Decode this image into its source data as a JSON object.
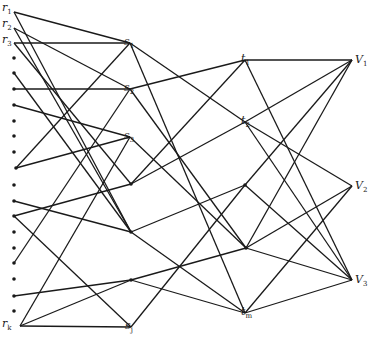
{
  "diagram": {
    "type": "layered-graph",
    "layers": [
      "r",
      "s",
      "t",
      "V"
    ],
    "nodes": {
      "r": [
        {
          "id": "r1",
          "label": "r",
          "sub": "1",
          "x": 14,
          "y": 12
        },
        {
          "id": "r2",
          "label": "r",
          "sub": "2",
          "x": 14,
          "y": 28
        },
        {
          "id": "r3",
          "label": "r",
          "sub": "3",
          "x": 14,
          "y": 43
        },
        {
          "id": "r4",
          "x": 14,
          "y": 58
        },
        {
          "id": "r5",
          "x": 14,
          "y": 73
        },
        {
          "id": "r6",
          "x": 14,
          "y": 89
        },
        {
          "id": "r7",
          "x": 14,
          "y": 105
        },
        {
          "id": "r8",
          "x": 14,
          "y": 121
        },
        {
          "id": "r9",
          "x": 14,
          "y": 136
        },
        {
          "id": "r10",
          "x": 14,
          "y": 152
        },
        {
          "id": "r11",
          "x": 16,
          "y": 168
        },
        {
          "id": "r12",
          "x": 14,
          "y": 185
        },
        {
          "id": "r13",
          "x": 14,
          "y": 201
        },
        {
          "id": "r14",
          "x": 14,
          "y": 216
        },
        {
          "id": "r15",
          "x": 14,
          "y": 232
        },
        {
          "id": "r16",
          "x": 14,
          "y": 248
        },
        {
          "id": "r17",
          "x": 14,
          "y": 263
        },
        {
          "id": "r18",
          "x": 14,
          "y": 279
        },
        {
          "id": "r19",
          "x": 14,
          "y": 296
        },
        {
          "id": "r20",
          "x": 14,
          "y": 311
        },
        {
          "id": "rk",
          "label": "r",
          "sub": "k",
          "x": 20,
          "y": 326
        }
      ],
      "s": [
        {
          "id": "s1",
          "label": "s",
          "sub": "1",
          "x": 130,
          "y": 43
        },
        {
          "id": "s2",
          "label": "s",
          "sub": "2",
          "x": 130,
          "y": 89
        },
        {
          "id": "s3",
          "label": "s",
          "sub": "3",
          "x": 130,
          "y": 137
        },
        {
          "id": "s4",
          "x": 131,
          "y": 184
        },
        {
          "id": "s5",
          "x": 131,
          "y": 232
        },
        {
          "id": "s6",
          "x": 131,
          "y": 280
        },
        {
          "id": "sj",
          "label": "s",
          "sub": "j",
          "x": 131,
          "y": 327
        }
      ],
      "t": [
        {
          "id": "t1",
          "label": "t",
          "sub": "1",
          "x": 245,
          "y": 60
        },
        {
          "id": "t2",
          "label": "t",
          "sub": "2",
          "x": 245,
          "y": 122
        },
        {
          "id": "t3",
          "x": 245,
          "y": 185
        },
        {
          "id": "t4",
          "x": 246,
          "y": 248
        },
        {
          "id": "tm",
          "label": "t",
          "sub": "m",
          "x": 245,
          "y": 313
        }
      ],
      "V": [
        {
          "id": "V1",
          "label": "V",
          "sub": "1",
          "x": 352,
          "y": 60
        },
        {
          "id": "V2",
          "label": "V",
          "sub": "2",
          "x": 352,
          "y": 186
        },
        {
          "id": "V3",
          "label": "V",
          "sub": "3",
          "x": 352,
          "y": 280
        }
      ]
    },
    "edges": [
      [
        "r1",
        "s1"
      ],
      [
        "r1",
        "s5"
      ],
      [
        "r2",
        "s2"
      ],
      [
        "r2",
        "s5"
      ],
      [
        "r3",
        "s1"
      ],
      [
        "r3",
        "s4"
      ],
      [
        "r5",
        "s5"
      ],
      [
        "r6",
        "s2"
      ],
      [
        "r7",
        "s3"
      ],
      [
        "r11",
        "s1"
      ],
      [
        "r11",
        "s3"
      ],
      [
        "r13",
        "s5"
      ],
      [
        "r14",
        "s4"
      ],
      [
        "r14",
        "sj"
      ],
      [
        "r17",
        "s2"
      ],
      [
        "r19",
        "s6"
      ],
      [
        "rk",
        "sj"
      ],
      [
        "rk",
        "s6"
      ],
      [
        "rk",
        "s3"
      ],
      [
        "s1",
        "t2"
      ],
      [
        "s1",
        "tm"
      ],
      [
        "s2",
        "t1"
      ],
      [
        "s2",
        "t4"
      ],
      [
        "s3",
        "t4"
      ],
      [
        "s4",
        "t1"
      ],
      [
        "s4",
        "t2"
      ],
      [
        "s5",
        "t3"
      ],
      [
        "s5",
        "tm"
      ],
      [
        "s6",
        "t4"
      ],
      [
        "s6",
        "tm"
      ],
      [
        "sj",
        "t3"
      ],
      [
        "t1",
        "V1"
      ],
      [
        "t1",
        "V3"
      ],
      [
        "t2",
        "V1"
      ],
      [
        "t2",
        "V2"
      ],
      [
        "t2",
        "V3"
      ],
      [
        "t3",
        "V1"
      ],
      [
        "t3",
        "V3"
      ],
      [
        "t4",
        "V1"
      ],
      [
        "t4",
        "V2"
      ],
      [
        "t4",
        "V3"
      ],
      [
        "tm",
        "V2"
      ],
      [
        "tm",
        "V3"
      ]
    ],
    "colors": {
      "stroke": "#1a1a1a",
      "background": "#ffffff"
    }
  },
  "labels": {
    "r1": "r",
    "r1_sub": "1",
    "r2": "r",
    "r2_sub": "2",
    "r3": "r",
    "r3_sub": "3",
    "rk": "r",
    "rk_sub": "k",
    "s1": "s",
    "s1_sub": "1",
    "s2": "s",
    "s2_sub": "2",
    "s3": "s",
    "s3_sub": "3",
    "sj": "s",
    "sj_sub": "j",
    "t1": "t",
    "t1_sub": "1",
    "t2": "t",
    "t2_sub": "2",
    "tm": "t",
    "tm_sub": "m",
    "V1": "V",
    "V1_sub": "1",
    "V2": "V",
    "V2_sub": "2",
    "V3": "V",
    "V3_sub": "3"
  }
}
